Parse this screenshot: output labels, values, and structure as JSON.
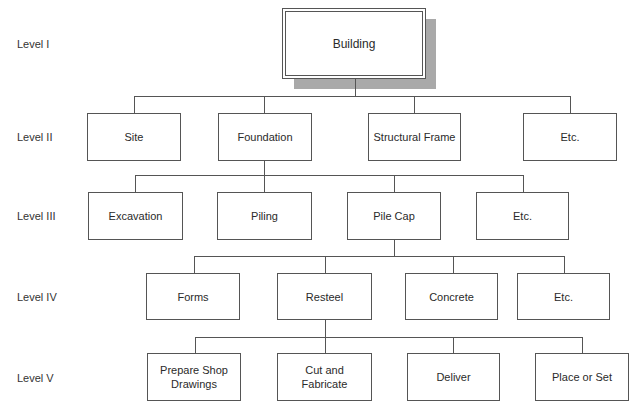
{
  "levels": [
    {
      "label": "Level I",
      "y": 44
    },
    {
      "label": "Level II",
      "y": 137
    },
    {
      "label": "Level III",
      "y": 216
    },
    {
      "label": "Level IV",
      "y": 297
    },
    {
      "label": "Level V",
      "y": 378
    }
  ],
  "root": {
    "label": "Building"
  },
  "level2": [
    {
      "label": "Site"
    },
    {
      "label": "Foundation"
    },
    {
      "label": "Structural Frame"
    },
    {
      "label": "Etc."
    }
  ],
  "level3": [
    {
      "label": "Excavation"
    },
    {
      "label": "Piling"
    },
    {
      "label": "Pile Cap"
    },
    {
      "label": "Etc."
    }
  ],
  "level4": [
    {
      "label": "Forms"
    },
    {
      "label": "Resteel"
    },
    {
      "label": "Concrete"
    },
    {
      "label": "Etc."
    }
  ],
  "level5": [
    {
      "label": "Prepare Shop Drawings"
    },
    {
      "label": "Cut and Fabricate"
    },
    {
      "label": "Deliver"
    },
    {
      "label": "Place or Set"
    }
  ],
  "colors": {
    "line": "#555555",
    "shadow": "#a9a9a9",
    "background": "#ffffff"
  }
}
